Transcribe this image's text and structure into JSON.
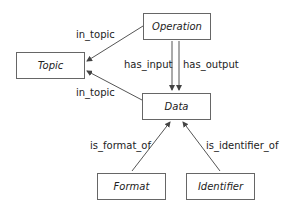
{
  "nodes": {
    "operation": "Operation",
    "topic": "Topic",
    "data": "Data",
    "format": "Format",
    "identifier": "Identifier"
  },
  "edges": {
    "op_topic": "in_topic",
    "data_topic": "in_topic",
    "has_input": "has_input",
    "has_output": "has_output",
    "is_format_of": "is_format_of",
    "is_identifier_of": "is_identifier_of"
  },
  "colors": {
    "line": "#555555",
    "border": "#666666",
    "text": "#222222"
  }
}
